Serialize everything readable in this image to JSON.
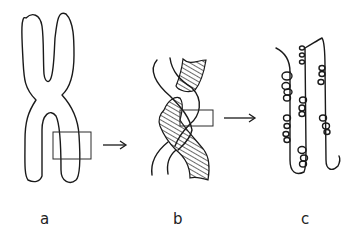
{
  "figure": {
    "panels": [
      {
        "id": "a",
        "label": "a",
        "description": "Condensed X-shaped chromosome with rectangular region highlighted on lower right arm"
      },
      {
        "id": "b",
        "label": "b",
        "description": "Magnified region showing two twisted chromatid strands, one hatched, with rectangular region highlighted"
      },
      {
        "id": "c",
        "label": "c",
        "description": "Further magnified region showing decondensed chromatin fibers with looped coils"
      }
    ],
    "arrows": [
      {
        "from": "a",
        "to": "b",
        "direction": "right"
      },
      {
        "from": "b",
        "to": "c",
        "direction": "right"
      }
    ],
    "colors": {
      "line": "#1a1a1a",
      "background": "#ffffff"
    }
  }
}
